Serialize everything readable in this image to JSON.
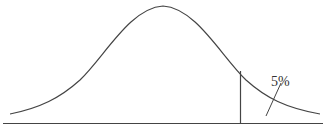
{
  "diagram": {
    "type": "normal-distribution",
    "tail_label": "5%",
    "colors": {
      "stroke": "#444444",
      "background": "#ffffff"
    }
  }
}
